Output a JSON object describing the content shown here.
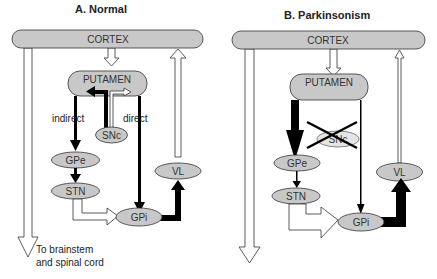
{
  "panels": [
    {
      "id": "A",
      "title": "A.  Normal",
      "nodes": {
        "cortex": "CORTEX",
        "putamen": "PUTAMEN",
        "snc": "SNc",
        "gpe": "GPe",
        "stn": "STN",
        "gpi": "GPi",
        "vl": "VL"
      },
      "pathway_labels": {
        "indirect": "indirect",
        "direct": "direct"
      },
      "output_label_line1": "To brainstem",
      "output_label_line2": "and spinal cord"
    },
    {
      "id": "B",
      "title": "B.  Parkinsonism",
      "nodes": {
        "cortex": "CORTEX",
        "putamen": "PUTAMEN",
        "snc": "SNc",
        "gpe": "GPe",
        "stn": "STN",
        "gpi": "GPi",
        "vl": "VL"
      },
      "snc_state": "crossed-out (degenerated)"
    }
  ],
  "colors": {
    "node_fill": "#c8c8c8",
    "inhibitory_arrow": "#000000",
    "excitatory_arrow": "#ffffff"
  }
}
